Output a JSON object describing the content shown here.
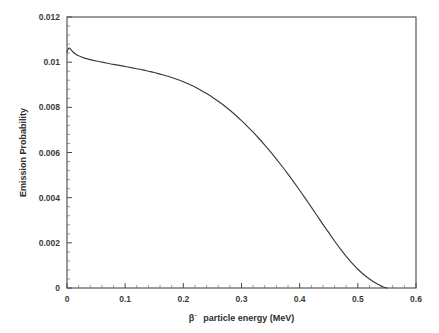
{
  "chart_data": {
    "type": "line",
    "title": "",
    "subtitle": "",
    "xlabel": "β  particle energy (MeV)",
    "xlabel_beta": "β",
    "xlabel_superscript": "-",
    "xlabel_rest": "particle energy (MeV)",
    "ylabel": "Emission Probability",
    "xlim": [
      0,
      0.6
    ],
    "ylim": [
      0,
      0.012
    ],
    "x_major_ticks": [
      0,
      0.1,
      0.2,
      0.3,
      0.4,
      0.5,
      0.6
    ],
    "x_tick_labels": [
      "0",
      "0.1",
      "0.2",
      "0.3",
      "0.4",
      "0.5",
      "0.6"
    ],
    "y_major_ticks": [
      0,
      0.002,
      0.004,
      0.006,
      0.008,
      0.01,
      0.012
    ],
    "y_tick_labels": [
      "0",
      "0.002",
      "0.004",
      "0.006",
      "0.008",
      "0.01",
      "0.012"
    ],
    "x_minor_per_major": 5,
    "y_minor_per_major": 5,
    "grid": false,
    "legend": null,
    "legend_position": "none",
    "series": [
      {
        "name": "beta spectrum",
        "color": "#3b3b3b",
        "x": [
          0.0,
          0.002,
          0.004,
          0.006,
          0.01,
          0.015,
          0.02,
          0.03,
          0.04,
          0.05,
          0.06,
          0.07,
          0.08,
          0.09,
          0.1,
          0.11,
          0.12,
          0.13,
          0.14,
          0.15,
          0.16,
          0.17,
          0.18,
          0.19,
          0.2,
          0.21,
          0.22,
          0.23,
          0.24,
          0.25,
          0.26,
          0.27,
          0.28,
          0.29,
          0.3,
          0.31,
          0.32,
          0.33,
          0.34,
          0.35,
          0.36,
          0.37,
          0.38,
          0.39,
          0.4,
          0.41,
          0.42,
          0.43,
          0.44,
          0.45,
          0.46,
          0.47,
          0.48,
          0.49,
          0.5,
          0.51,
          0.52,
          0.53,
          0.54,
          0.545,
          0.55
        ],
        "y": [
          0.01045,
          0.01058,
          0.01062,
          0.01058,
          0.01046,
          0.01035,
          0.01028,
          0.01018,
          0.01011,
          0.01005,
          0.01,
          0.00995,
          0.0099,
          0.00986,
          0.00981,
          0.00976,
          0.00971,
          0.00966,
          0.0096,
          0.00954,
          0.00947,
          0.0094,
          0.00932,
          0.00923,
          0.00913,
          0.00902,
          0.0089,
          0.00876,
          0.00861,
          0.00845,
          0.00827,
          0.00808,
          0.00787,
          0.00765,
          0.00741,
          0.00716,
          0.0069,
          0.00662,
          0.00633,
          0.00603,
          0.00571,
          0.00538,
          0.00504,
          0.00469,
          0.00433,
          0.00396,
          0.00358,
          0.0032,
          0.00282,
          0.00245,
          0.00208,
          0.00173,
          0.0014,
          0.0011,
          0.00083,
          0.0006,
          0.0004,
          0.00023,
          9e-05,
          3e-05,
          0.0
        ],
        "endpoint_energy": 0.55,
        "peak_value": 0.01062
      }
    ],
    "axes_geometry": {
      "plot_left": 67,
      "plot_right": 416,
      "plot_top": 17,
      "plot_bottom": 288
    }
  }
}
